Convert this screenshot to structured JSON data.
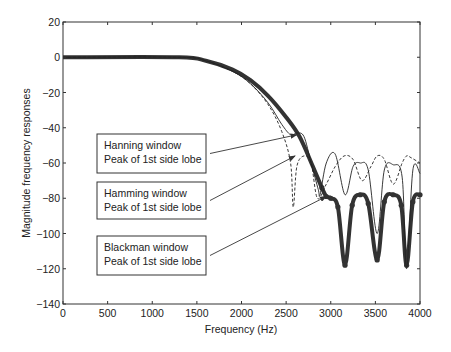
{
  "chart_data": {
    "type": "line",
    "title": "",
    "xlabel": "Frequency (Hz)",
    "ylabel": "Magnitude frequency responses",
    "xlim": [
      0,
      4000
    ],
    "ylim": [
      -140,
      20
    ],
    "xticks": [
      "0",
      "500",
      "1000",
      "1500",
      "2000",
      "2500",
      "3000",
      "3500",
      "4000"
    ],
    "yticks": [
      "20",
      "0",
      "-20",
      "-40",
      "-60",
      "-80",
      "-100",
      "-120",
      "-140"
    ],
    "grid": false,
    "series": [
      {
        "name": "Blackman window",
        "style": "thick solid with circle markers",
        "x": [
          0,
          1300,
          1600,
          1900,
          2100,
          2300,
          2500,
          2650,
          2800,
          2900,
          2950,
          3000,
          3080,
          3160,
          3240,
          3330,
          3420,
          3520,
          3600,
          3700,
          3790,
          3850,
          3920,
          4000
        ],
        "y": [
          0,
          0,
          -2,
          -7,
          -13,
          -22,
          -34,
          -45,
          -62,
          -74,
          -79,
          -80,
          -85,
          -118,
          -84,
          -78,
          -83,
          -115,
          -82,
          -78,
          -84,
          -118,
          -82,
          -78
        ]
      },
      {
        "name": "Hanning window",
        "style": "dashed",
        "x": [
          0,
          1300,
          1600,
          1900,
          2100,
          2300,
          2450,
          2550,
          2580,
          2620,
          2700,
          2780,
          2850,
          2950,
          3050,
          3150,
          3250,
          3350,
          3450,
          3520,
          3600,
          3700,
          3800,
          3850,
          3900,
          4000
        ],
        "y": [
          0,
          0,
          -2,
          -8,
          -15,
          -27,
          -42,
          -60,
          -85,
          -62,
          -56,
          -60,
          -80,
          -72,
          -62,
          -56,
          -58,
          -70,
          -62,
          -56,
          -58,
          -72,
          -60,
          -56,
          -57,
          -60
        ]
      },
      {
        "name": "Hamming window",
        "style": "thin solid",
        "x": [
          0,
          1300,
          1600,
          1900,
          2100,
          2300,
          2450,
          2550,
          2620,
          2700,
          2780,
          2860,
          2880,
          2950,
          3050,
          3160,
          3250,
          3330,
          3420,
          3520,
          3600,
          3700,
          3800,
          3850,
          3920,
          4000
        ],
        "y": [
          0,
          0,
          -2,
          -8,
          -15,
          -26,
          -38,
          -44,
          -43,
          -45,
          -60,
          -75,
          -78,
          -60,
          -55,
          -78,
          -62,
          -60,
          -64,
          -100,
          -64,
          -61,
          -68,
          -120,
          -64,
          -66
        ]
      }
    ],
    "annotations": [
      {
        "text": [
          "Hanning window",
          "Peak of 1st side lobe"
        ],
        "points_to": [
          2620,
          -44
        ]
      },
      {
        "text": [
          "Hamming window",
          "Peak of 1st side lobe"
        ],
        "points_to": [
          2600,
          -56
        ]
      },
      {
        "text": [
          "Blackman window",
          "Peak of 1st side lobe"
        ],
        "points_to": [
          2950,
          -79
        ]
      }
    ],
    "legend": null
  }
}
